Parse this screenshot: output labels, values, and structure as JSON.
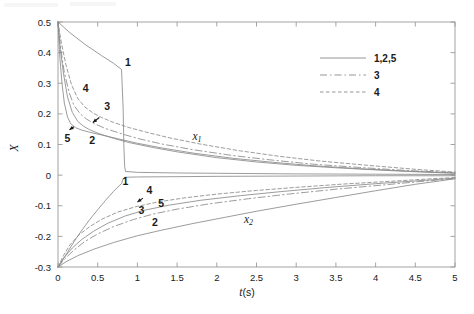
{
  "chart_data": {
    "type": "line",
    "title": "",
    "xlabel": "t(s)",
    "ylabel": "X",
    "xlim": [
      0,
      5
    ],
    "ylim": [
      -0.3,
      0.5
    ],
    "xticks": [
      0,
      0.5,
      1,
      1.5,
      2,
      2.5,
      3,
      3.5,
      4,
      4.5,
      5
    ],
    "xticklabels": [
      "0",
      "0.5",
      "1",
      "1.5",
      "2",
      "2.5",
      "3",
      "3.5",
      "4",
      "4.5",
      "5"
    ],
    "yticks": [
      -0.3,
      -0.2,
      -0.1,
      0,
      0.1,
      0.2,
      0.3,
      0.4,
      0.5
    ],
    "yticklabels": [
      "-0.3",
      "-0.2",
      "-0.1",
      "0",
      "0.1",
      "0.2",
      "0.3",
      "0.4",
      "0.5"
    ],
    "grid": false,
    "legend_position": "upper right",
    "legend": [
      {
        "label": "1,2,5",
        "style": "solid"
      },
      {
        "label": "3",
        "style": "dashdot"
      },
      {
        "label": "4",
        "style": "dotted"
      }
    ],
    "annotations": [
      {
        "text": "x₁",
        "x": 1.75,
        "y": 0.115,
        "group": "upper"
      },
      {
        "text": "x₂",
        "x": 2.4,
        "y": -0.155,
        "group": "lower"
      },
      {
        "text": "1",
        "x": 0.88,
        "y": 0.355,
        "group": "upper"
      },
      {
        "text": "4",
        "x": 0.35,
        "y": 0.272,
        "group": "upper"
      },
      {
        "text": "3",
        "x": 0.62,
        "y": 0.213,
        "group": "upper"
      },
      {
        "text": "5",
        "x": 0.12,
        "y": 0.108,
        "group": "upper"
      },
      {
        "text": "2",
        "x": 0.43,
        "y": 0.102,
        "group": "upper"
      },
      {
        "text": "1",
        "x": 0.85,
        "y": -0.032,
        "group": "lower"
      },
      {
        "text": "4",
        "x": 1.15,
        "y": -0.063,
        "group": "lower"
      },
      {
        "text": "5",
        "x": 1.3,
        "y": -0.105,
        "group": "lower"
      },
      {
        "text": "3",
        "x": 1.05,
        "y": -0.128,
        "group": "lower"
      },
      {
        "text": "2",
        "x": 1.22,
        "y": -0.167,
        "group": "lower"
      }
    ],
    "series": [
      {
        "name": "1 upper",
        "style": "solid",
        "points": [
          [
            0,
            0.5
          ],
          [
            0.15,
            0.465
          ],
          [
            0.35,
            0.425
          ],
          [
            0.55,
            0.39
          ],
          [
            0.7,
            0.365
          ],
          [
            0.8,
            0.345
          ],
          [
            0.8,
            0.345
          ],
          [
            0.82,
            0.22
          ],
          [
            0.83,
            0.09
          ],
          [
            0.84,
            0.028
          ],
          [
            0.85,
            0.012
          ],
          [
            1.0,
            0.009
          ],
          [
            1.5,
            0.007
          ],
          [
            2.0,
            0.006
          ],
          [
            3.0,
            0.004
          ],
          [
            4.0,
            0.003
          ],
          [
            5.0,
            0.002
          ]
        ]
      },
      {
        "name": "2 upper",
        "style": "solid",
        "points": [
          [
            0,
            0.5
          ],
          [
            0.03,
            0.41
          ],
          [
            0.07,
            0.33
          ],
          [
            0.12,
            0.255
          ],
          [
            0.18,
            0.205
          ],
          [
            0.25,
            0.175
          ],
          [
            0.32,
            0.16
          ],
          [
            0.4,
            0.148
          ],
          [
            0.5,
            0.137
          ],
          [
            0.7,
            0.12
          ],
          [
            0.9,
            0.106
          ],
          [
            1.2,
            0.09
          ],
          [
            1.5,
            0.076
          ],
          [
            2.0,
            0.057
          ],
          [
            2.5,
            0.043
          ],
          [
            3.0,
            0.032
          ],
          [
            3.5,
            0.024
          ],
          [
            4.0,
            0.017
          ],
          [
            4.5,
            0.011
          ],
          [
            5.0,
            0.006
          ]
        ]
      },
      {
        "name": "5 upper",
        "style": "solid",
        "points": [
          [
            0,
            0.5
          ],
          [
            0.02,
            0.395
          ],
          [
            0.05,
            0.3
          ],
          [
            0.08,
            0.235
          ],
          [
            0.12,
            0.19
          ],
          [
            0.16,
            0.168
          ],
          [
            0.22,
            0.155
          ],
          [
            0.3,
            0.147
          ],
          [
            0.4,
            0.14
          ],
          [
            0.55,
            0.131
          ],
          [
            0.75,
            0.119
          ],
          [
            1.0,
            0.104
          ],
          [
            1.3,
            0.089
          ],
          [
            1.7,
            0.072
          ],
          [
            2.2,
            0.055
          ],
          [
            2.7,
            0.042
          ],
          [
            3.2,
            0.031
          ],
          [
            3.8,
            0.021
          ],
          [
            4.4,
            0.013
          ],
          [
            5.0,
            0.007
          ]
        ]
      },
      {
        "name": "3 upper",
        "style": "dashdot",
        "points": [
          [
            0,
            0.5
          ],
          [
            0.03,
            0.42
          ],
          [
            0.08,
            0.335
          ],
          [
            0.14,
            0.27
          ],
          [
            0.2,
            0.228
          ],
          [
            0.28,
            0.2
          ],
          [
            0.36,
            0.183
          ],
          [
            0.45,
            0.169
          ],
          [
            0.6,
            0.152
          ],
          [
            0.8,
            0.135
          ],
          [
            1.0,
            0.12
          ],
          [
            1.3,
            0.102
          ],
          [
            1.7,
            0.083
          ],
          [
            2.2,
            0.064
          ],
          [
            2.7,
            0.049
          ],
          [
            3.2,
            0.036
          ],
          [
            3.8,
            0.025
          ],
          [
            4.4,
            0.015
          ],
          [
            5.0,
            0.008
          ]
        ]
      },
      {
        "name": "4 upper",
        "style": "dotted",
        "points": [
          [
            0,
            0.5
          ],
          [
            0.04,
            0.435
          ],
          [
            0.1,
            0.36
          ],
          [
            0.17,
            0.295
          ],
          [
            0.25,
            0.25
          ],
          [
            0.34,
            0.222
          ],
          [
            0.44,
            0.203
          ],
          [
            0.55,
            0.188
          ],
          [
            0.7,
            0.172
          ],
          [
            0.9,
            0.155
          ],
          [
            1.1,
            0.141
          ],
          [
            1.4,
            0.122
          ],
          [
            1.8,
            0.101
          ],
          [
            2.3,
            0.079
          ],
          [
            2.8,
            0.061
          ],
          [
            3.3,
            0.046
          ],
          [
            3.9,
            0.032
          ],
          [
            4.5,
            0.019
          ],
          [
            5.0,
            0.01
          ]
        ]
      },
      {
        "name": "1 lower",
        "style": "solid",
        "points": [
          [
            0,
            -0.3
          ],
          [
            0.1,
            -0.26
          ],
          [
            0.2,
            -0.218
          ],
          [
            0.3,
            -0.18
          ],
          [
            0.4,
            -0.145
          ],
          [
            0.5,
            -0.113
          ],
          [
            0.6,
            -0.082
          ],
          [
            0.7,
            -0.053
          ],
          [
            0.78,
            -0.032
          ],
          [
            0.8,
            -0.028
          ],
          [
            0.8,
            -0.028
          ],
          [
            0.82,
            -0.012
          ],
          [
            0.85,
            -0.007
          ],
          [
            1.0,
            -0.006
          ],
          [
            1.5,
            -0.005
          ],
          [
            2.0,
            -0.004
          ],
          [
            3.0,
            -0.003
          ],
          [
            4.0,
            -0.002
          ],
          [
            5.0,
            -0.002
          ]
        ]
      },
      {
        "name": "2 lower",
        "style": "solid",
        "points": [
          [
            0,
            -0.3
          ],
          [
            0.1,
            -0.283
          ],
          [
            0.25,
            -0.263
          ],
          [
            0.45,
            -0.242
          ],
          [
            0.7,
            -0.22
          ],
          [
            1.0,
            -0.198
          ],
          [
            1.3,
            -0.18
          ],
          [
            1.7,
            -0.158
          ],
          [
            2.1,
            -0.138
          ],
          [
            2.5,
            -0.118
          ],
          [
            3.0,
            -0.095
          ],
          [
            3.5,
            -0.073
          ],
          [
            4.0,
            -0.051
          ],
          [
            4.5,
            -0.03
          ],
          [
            5.0,
            -0.012
          ]
        ]
      },
      {
        "name": "5 lower",
        "style": "solid",
        "points": [
          [
            0,
            -0.3
          ],
          [
            0.08,
            -0.268
          ],
          [
            0.18,
            -0.238
          ],
          [
            0.3,
            -0.21
          ],
          [
            0.45,
            -0.183
          ],
          [
            0.62,
            -0.158
          ],
          [
            0.85,
            -0.133
          ],
          [
            1.1,
            -0.114
          ],
          [
            1.4,
            -0.098
          ],
          [
            1.8,
            -0.082
          ],
          [
            2.3,
            -0.067
          ],
          [
            2.8,
            -0.054
          ],
          [
            3.4,
            -0.04
          ],
          [
            4.0,
            -0.028
          ],
          [
            4.5,
            -0.019
          ],
          [
            5.0,
            -0.01
          ]
        ]
      },
      {
        "name": "3 lower",
        "style": "dashdot",
        "points": [
          [
            0,
            -0.3
          ],
          [
            0.09,
            -0.272
          ],
          [
            0.2,
            -0.245
          ],
          [
            0.33,
            -0.218
          ],
          [
            0.5,
            -0.192
          ],
          [
            0.7,
            -0.168
          ],
          [
            0.95,
            -0.145
          ],
          [
            1.2,
            -0.127
          ],
          [
            1.5,
            -0.111
          ],
          [
            1.9,
            -0.094
          ],
          [
            2.4,
            -0.077
          ],
          [
            2.9,
            -0.062
          ],
          [
            3.5,
            -0.046
          ],
          [
            4.1,
            -0.032
          ],
          [
            4.6,
            -0.02
          ],
          [
            5.0,
            -0.011
          ]
        ]
      },
      {
        "name": "4 lower",
        "style": "dotted",
        "points": [
          [
            0,
            -0.3
          ],
          [
            0.07,
            -0.262
          ],
          [
            0.15,
            -0.228
          ],
          [
            0.26,
            -0.196
          ],
          [
            0.4,
            -0.168
          ],
          [
            0.56,
            -0.143
          ],
          [
            0.75,
            -0.121
          ],
          [
            0.98,
            -0.103
          ],
          [
            1.25,
            -0.088
          ],
          [
            1.6,
            -0.074
          ],
          [
            2.0,
            -0.062
          ],
          [
            2.5,
            -0.05
          ],
          [
            3.0,
            -0.04
          ],
          [
            3.6,
            -0.029
          ],
          [
            4.2,
            -0.02
          ],
          [
            4.7,
            -0.012
          ],
          [
            5.0,
            -0.008
          ]
        ]
      }
    ]
  },
  "style": {
    "line_color": "#8a8a8a",
    "axis_color": "#9a9a9a",
    "text_color": "#1a1a1a",
    "background": "#ffffff"
  }
}
